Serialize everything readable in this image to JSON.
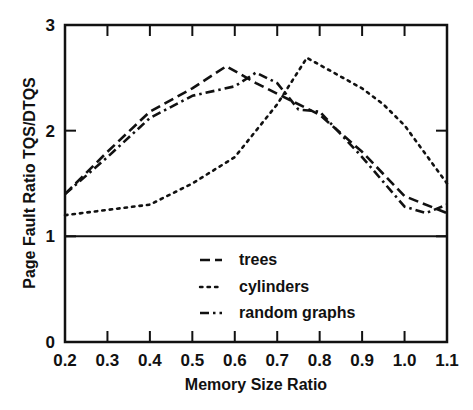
{
  "chart_data": {
    "type": "line",
    "title": "",
    "xlabel": "Memory Size Ratio",
    "ylabel": "Page Fault Ratio TQS/DTQS",
    "xlim": [
      0.2,
      1.1
    ],
    "ylim": [
      0,
      3
    ],
    "xticks": [
      "0.2",
      "0.3",
      "0.4",
      "0.5",
      "0.6",
      "0.7",
      "0.8",
      "0.9",
      "1.0",
      "1.1"
    ],
    "yticks": [
      "0",
      "1",
      "2",
      "3"
    ],
    "grid": false,
    "reference_line": {
      "y": 1
    },
    "legend_position": "inside lower center",
    "series": [
      {
        "name": "trees",
        "style": "dashed",
        "x": [
          0.2,
          0.3,
          0.4,
          0.5,
          0.58,
          0.65,
          0.7,
          0.8,
          0.9,
          1.0,
          1.1
        ],
        "values": [
          1.4,
          1.8,
          2.18,
          2.4,
          2.61,
          2.45,
          2.35,
          2.15,
          1.8,
          1.38,
          1.22
        ]
      },
      {
        "name": "cylinders",
        "style": "dotted",
        "x": [
          0.2,
          0.3,
          0.4,
          0.5,
          0.6,
          0.7,
          0.77,
          0.9,
          0.95,
          1.0,
          1.1
        ],
        "values": [
          1.2,
          1.25,
          1.3,
          1.5,
          1.75,
          2.25,
          2.69,
          2.4,
          2.25,
          2.05,
          1.5
        ]
      },
      {
        "name": "random graphs",
        "style": "dash-dot",
        "x": [
          0.2,
          0.3,
          0.4,
          0.5,
          0.6,
          0.65,
          0.7,
          0.75,
          0.8,
          0.9,
          1.0,
          1.05,
          1.1
        ],
        "values": [
          1.4,
          1.75,
          2.12,
          2.33,
          2.42,
          2.55,
          2.45,
          2.2,
          2.18,
          1.75,
          1.28,
          1.22,
          1.3
        ]
      }
    ]
  },
  "legend": {
    "items": [
      {
        "label": "trees"
      },
      {
        "label": "cylinders"
      },
      {
        "label": "random graphs"
      }
    ]
  }
}
